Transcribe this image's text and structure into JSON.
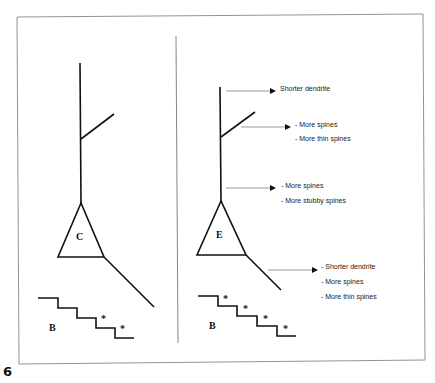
{
  "figure": {
    "number": "6",
    "left_panel": {
      "soma_label": "C",
      "staircase_label": "B",
      "staircase_marks": [
        "*",
        "*"
      ]
    },
    "right_panel": {
      "soma_label": "E",
      "staircase_label": "B",
      "staircase_marks": [
        "*",
        "*",
        "*",
        "*"
      ],
      "annotations": {
        "apical_tip": [
          "Shorter dendrite"
        ],
        "oblique_branch": [
          "- More spines",
          "- More thin spines"
        ],
        "apical_trunk": [
          "- More spines",
          "- More stubby spines"
        ],
        "basal_dendrite": [
          "- Shorter dendrite",
          "- More spines",
          "- More thin spines"
        ]
      }
    }
  },
  "colors": {
    "line": "#111111",
    "arrow": "#555555",
    "frame": "#666666"
  }
}
